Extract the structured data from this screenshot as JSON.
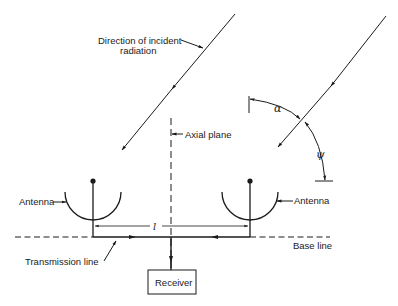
{
  "diagram": {
    "type": "two-element radio interferometer schematic",
    "labels": {
      "incident_line1": "Direction of incident",
      "incident_line2": "radiation",
      "axial_plane": "Axial plane",
      "antenna_left": "Antenna",
      "antenna_right": "Antenna",
      "base_line": "Base line",
      "transmission_line": "Transmission line",
      "receiver": "Receiver",
      "baseline_length_symbol": "l",
      "alpha_symbol": "α",
      "psi_symbol": "ψ"
    },
    "colors": {
      "stroke": "#1a1a1a",
      "background": "#ffffff"
    }
  }
}
